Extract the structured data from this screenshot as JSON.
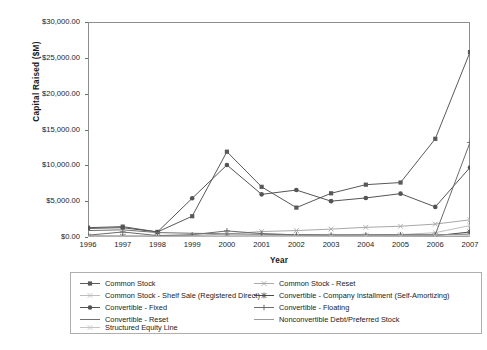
{
  "chart_data": {
    "type": "line",
    "title": "",
    "xlabel": "Year",
    "ylabel": "Capital Raised ($M)",
    "x": [
      1996,
      1997,
      1998,
      1999,
      2000,
      2001,
      2002,
      2003,
      2004,
      2005,
      2006,
      2007
    ],
    "categories": [
      "1996",
      "1997",
      "1998",
      "1999",
      "2000",
      "2001",
      "2002",
      "2003",
      "2004",
      "2005",
      "2006",
      "2007"
    ],
    "xlim": [
      1996,
      2007
    ],
    "ylim": [
      0,
      30000
    ],
    "ytick_labels": [
      "$0.00",
      "$5,000.00",
      "$10,000.00",
      "$15,000.00",
      "$20,000.00",
      "$25,000.00",
      "$30,000.00"
    ],
    "ytick_values": [
      0,
      5000,
      10000,
      15000,
      20000,
      25000,
      30000
    ],
    "grid": false,
    "legend_position": "bottom",
    "series": [
      {
        "name": "Common Stock",
        "marker": "square",
        "color": "#595959",
        "values": [
          1300,
          1450,
          700,
          2900,
          11900,
          7000,
          4100,
          6100,
          7300,
          7600,
          13700,
          25800
        ]
      },
      {
        "name": "Common Stock - Reset",
        "marker": "cross-x",
        "color": "#a8a8a8",
        "values": [
          170,
          150,
          130,
          200,
          430,
          760,
          900,
          1100,
          1350,
          1500,
          1800,
          2400
        ]
      },
      {
        "name": "Common Stock - Shelf Sale (Registered Direct)",
        "marker": "cross-x",
        "color": "#bdbdbd",
        "values": [
          60,
          60,
          60,
          70,
          90,
          120,
          150,
          190,
          250,
          330,
          600,
          1600
        ]
      },
      {
        "name": "Convertible - Company Installment (Self-Amortizing)",
        "marker": "asterisk",
        "color": "#4a4a4a",
        "values": [
          40,
          40,
          40,
          50,
          60,
          70,
          80,
          90,
          110,
          130,
          170,
          700
        ]
      },
      {
        "name": "Convertible - Fixed",
        "marker": "circle",
        "color": "#545454",
        "values": [
          1200,
          1300,
          700,
          5400,
          10050,
          5950,
          6550,
          5000,
          5450,
          6050,
          4200,
          9700
        ]
      },
      {
        "name": "Convertible - Floating",
        "marker": "plus",
        "color": "#6b6b6b",
        "values": [
          250,
          700,
          200,
          320,
          850,
          480,
          300,
          260,
          280,
          300,
          330,
          13200
        ]
      },
      {
        "name": "Convertible - Reset",
        "marker": "line",
        "color": "#707070",
        "values": [
          900,
          1000,
          620,
          520,
          430,
          380,
          330,
          300,
          290,
          300,
          320,
          400
        ]
      },
      {
        "name": "Nonconvertible Debt/Preferred Stock",
        "marker": "line",
        "color": "#9a9a9a",
        "values": [
          120,
          120,
          110,
          120,
          140,
          150,
          170,
          190,
          210,
          240,
          280,
          340
        ]
      },
      {
        "name": "Structured Equity Line",
        "marker": "cross-x",
        "color": "#c4c4c4",
        "values": [
          30,
          30,
          30,
          40,
          50,
          60,
          70,
          80,
          90,
          100,
          120,
          160
        ]
      }
    ]
  },
  "axes": {
    "y_title": "Capital Raised ($M)",
    "x_title": "Year"
  },
  "legend": {
    "items": [
      {
        "label": "Common Stock",
        "marker": "square",
        "color": "#595959"
      },
      {
        "label": "Common Stock - Reset",
        "marker": "cross-x",
        "color": "#a8a8a8"
      },
      {
        "label": "Common Stock - Shelf Sale (Registered Direct)",
        "marker": "cross-x",
        "color": "#bdbdbd"
      },
      {
        "label": "Convertible - Company Installment (Self-Amortizing)",
        "marker": "asterisk",
        "color": "#4a4a4a"
      },
      {
        "label": "Convertible - Fixed",
        "marker": "circle",
        "color": "#545454"
      },
      {
        "label": "Convertible - Floating",
        "marker": "plus",
        "color": "#6b6b6b"
      },
      {
        "label": "Convertible - Reset",
        "marker": "line",
        "color": "#707070"
      },
      {
        "label": "Nonconvertible Debt/Preferred Stock",
        "marker": "line",
        "color": "#9a9a9a"
      },
      {
        "label": "Structured Equity Line",
        "marker": "cross-x",
        "color": "#c4c4c4"
      }
    ]
  }
}
